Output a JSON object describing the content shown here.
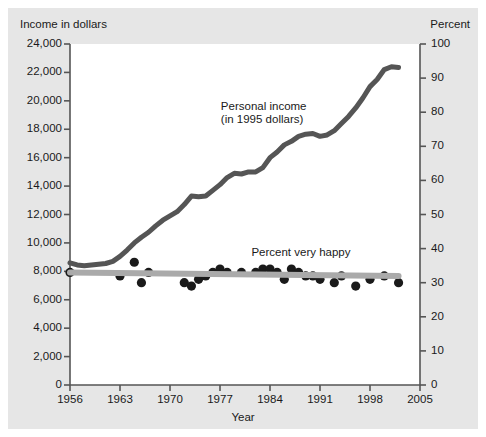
{
  "figure": {
    "background_color": "#e6e6e6",
    "plot_background_color": "#ffffff",
    "frame_color": "#555555"
  },
  "chart_data": {
    "type": "line",
    "title": "",
    "xlabel": "Year",
    "ylabel": "Income in dollars",
    "y2label": "Percent",
    "xlim": [
      1956,
      2005
    ],
    "ylim": [
      0,
      24000
    ],
    "y2lim": [
      0,
      100
    ],
    "grid": false,
    "legend_position": "inline-annotations",
    "xticks": [
      1956,
      1963,
      1970,
      1977,
      1984,
      1991,
      1998,
      2005
    ],
    "xtick_labels": [
      "1956",
      "1963",
      "1970",
      "1977",
      "1984",
      "1991",
      "1998",
      "2005"
    ],
    "yticks": [
      0,
      2000,
      4000,
      6000,
      8000,
      10000,
      12000,
      14000,
      16000,
      18000,
      20000,
      22000,
      24000
    ],
    "ytick_labels": [
      "0",
      "2,000",
      "4,000",
      "6,000",
      "8,000",
      "10,000",
      "12,000",
      "14,000",
      "16,000",
      "18,000",
      "20,000",
      "22,000",
      "24,000"
    ],
    "y2ticks": [
      0,
      10,
      20,
      30,
      40,
      50,
      60,
      70,
      80,
      90,
      100
    ],
    "y2tick_labels": [
      "0",
      "10",
      "20",
      "30",
      "40",
      "50",
      "60",
      "70",
      "80",
      "90",
      "100"
    ],
    "annotations": [
      {
        "text_line1": "Personal income",
        "text_line2": "(in 1995 dollars)",
        "x": 1983,
        "y": 19500
      },
      {
        "text_line1": "Percent very happy",
        "text_line2": "",
        "x": 1987,
        "y": 9200
      }
    ],
    "series": [
      {
        "name": "Personal income (in 1995 dollars)",
        "type": "line",
        "axis": "left",
        "color": "#555555",
        "linewidth": 5,
        "x": [
          1956,
          1957,
          1958,
          1959,
          1960,
          1961,
          1962,
          1963,
          1964,
          1965,
          1966,
          1967,
          1968,
          1969,
          1970,
          1971,
          1972,
          1973,
          1974,
          1975,
          1976,
          1977,
          1978,
          1979,
          1980,
          1981,
          1982,
          1983,
          1984,
          1985,
          1986,
          1987,
          1988,
          1989,
          1990,
          1991,
          1992,
          1993,
          1994,
          1995,
          1996,
          1997,
          1998,
          1999,
          2000,
          2001,
          2002
        ],
        "values": [
          8600,
          8450,
          8400,
          8450,
          8500,
          8550,
          8700,
          9050,
          9500,
          10000,
          10400,
          10750,
          11200,
          11600,
          11900,
          12200,
          12700,
          13300,
          13250,
          13300,
          13700,
          14100,
          14600,
          14900,
          14850,
          15000,
          15000,
          15300,
          16000,
          16400,
          16900,
          17150,
          17500,
          17650,
          17700,
          17500,
          17600,
          17900,
          18400,
          18900,
          19500,
          20200,
          21000,
          21500,
          22200,
          22400,
          22350
        ]
      },
      {
        "name": "Percent very happy",
        "type": "scatter",
        "axis": "right",
        "color": "#1a1a1a",
        "marker_size": 6,
        "x": [
          1956,
          1963,
          1965,
          1966,
          1967,
          1972,
          1973,
          1974,
          1975,
          1976,
          1977,
          1978,
          1980,
          1982,
          1983,
          1984,
          1985,
          1986,
          1987,
          1988,
          1989,
          1990,
          1991,
          1993,
          1994,
          1996,
          1998,
          2000,
          2002
        ],
        "values": [
          33,
          32,
          36,
          30,
          33,
          30,
          29,
          31,
          32,
          33,
          34,
          33,
          33,
          33,
          34,
          34,
          33,
          31,
          34,
          33,
          32,
          32,
          31,
          30,
          32,
          29,
          31,
          32,
          30
        ]
      },
      {
        "name": "Percent very happy trend",
        "type": "line",
        "axis": "right",
        "color": "#aaaaaa",
        "linewidth": 6,
        "x": [
          1956,
          2002
        ],
        "values": [
          33,
          32
        ]
      }
    ]
  }
}
